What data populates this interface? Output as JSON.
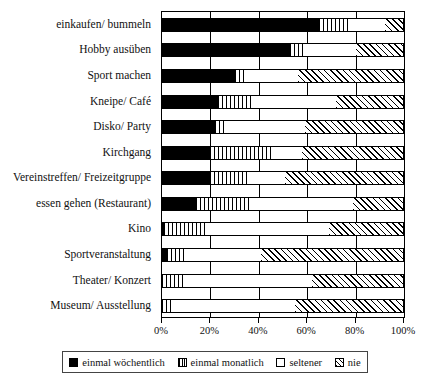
{
  "chart_data": {
    "type": "bar",
    "orientation": "horizontal",
    "stacked": true,
    "stack_mode": "percent",
    "title": "",
    "xlabel": "",
    "ylabel": "",
    "xlim": [
      0,
      100
    ],
    "grid": true,
    "grid_axis": "x",
    "legend_position": "bottom",
    "xtick_labels": [
      "0%",
      "20%",
      "40%",
      "60%",
      "80%",
      "100%"
    ],
    "xtick_values": [
      0,
      20,
      40,
      60,
      80,
      100
    ],
    "categories": [
      "einkaufen/ bummeln",
      "Hobby ausüben",
      "Sport machen",
      "Kneipe/ Café",
      "Disko/ Party",
      "Kirchgang",
      "Vereinstreffen/ Freizeitgruppe",
      "essen gehen (Restaurant)",
      "Kino",
      "Sportveranstaltung",
      "Theater/ Konzert",
      "Museum/ Ausstellung"
    ],
    "series": [
      {
        "name": "einmal wöchentlich",
        "key": "weekly",
        "pattern": "solid-black",
        "values": [
          65,
          53,
          30,
          23,
          22,
          20,
          20,
          14,
          1,
          2,
          0,
          0
        ]
      },
      {
        "name": "einmal monatlich",
        "key": "monthly",
        "pattern": "vertical-stripes",
        "values": [
          12,
          6,
          4,
          15,
          5,
          25,
          15,
          23,
          17,
          7,
          9,
          4
        ]
      },
      {
        "name": "seltener",
        "key": "seldom",
        "pattern": "white",
        "values": [
          15,
          21,
          22,
          34,
          32,
          13,
          16,
          42,
          51,
          32,
          53,
          51
        ]
      },
      {
        "name": "nie",
        "key": "never",
        "pattern": "diagonal-hatch",
        "values": [
          8,
          20,
          44,
          28,
          41,
          42,
          49,
          21,
          31,
          59,
          38,
          45
        ]
      }
    ]
  },
  "legend": {
    "items": [
      {
        "label": "einmal wöchentlich",
        "key": "weekly"
      },
      {
        "label": "einmal monatlich",
        "key": "monthly"
      },
      {
        "label": "seltener",
        "key": "seldom"
      },
      {
        "label": "nie",
        "key": "never"
      }
    ]
  },
  "colors": {
    "ink": "#000000",
    "background": "#ffffff",
    "text": "#111111"
  }
}
